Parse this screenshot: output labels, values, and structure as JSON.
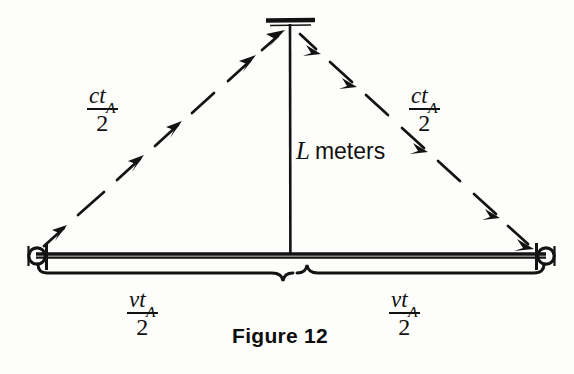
{
  "figure": {
    "caption": "Figure 12",
    "background_color": "#fdfdfb",
    "ink_color": "#111111",
    "style": "hand-drawn physics textbook diagram, light-clock / time-dilation triangle"
  },
  "labels": {
    "hypotenuse_left": {
      "numerator_main": "ct",
      "numerator_subscript": "A",
      "denominator": "2",
      "meaning": "ct_A / 2"
    },
    "hypotenuse_right": {
      "numerator_main": "ct",
      "numerator_subscript": "A",
      "denominator": "2",
      "meaning": "ct_A / 2"
    },
    "vertical": {
      "symbol": "L",
      "unit_text": "meters",
      "meaning": "L meters"
    },
    "base_left": {
      "numerator_main": "vt",
      "numerator_subscript": "A",
      "denominator": "2",
      "meaning": "vt_A / 2"
    },
    "base_right": {
      "numerator_main": "vt",
      "numerator_subscript": "A",
      "denominator": "2",
      "meaning": "vt_A / 2"
    }
  },
  "geometry": {
    "apex": {
      "x": 290,
      "y": 24
    },
    "left_endpoint": {
      "x": 36,
      "y": 256
    },
    "right_endpoint": {
      "x": 546,
      "y": 256
    },
    "baseline_y": 256,
    "mirror_bar": {
      "x1": 266,
      "x2": 314,
      "y": 21
    },
    "brace_left": {
      "x1": 38,
      "x2": 286,
      "y": 268
    },
    "brace_right": {
      "x1": 296,
      "x2": 544,
      "y": 268
    }
  },
  "icons": {
    "left_marker": "clock-circle-icon",
    "right_marker": "clock-circle-icon",
    "apex_marker": "mirror-bar-icon",
    "left_leg": "dashed-arrow-up-right-icon",
    "right_leg": "dashed-arrow-down-right-icon"
  }
}
